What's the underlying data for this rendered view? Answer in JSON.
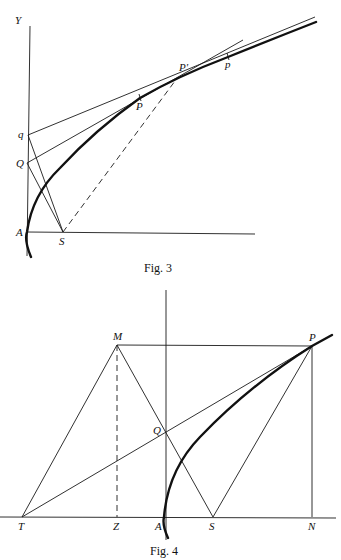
{
  "figures": [
    {
      "id": "fig3",
      "caption": "Fig. 3",
      "labels": {
        "Y": "Y",
        "q": "q",
        "Q": "Q",
        "A": "A",
        "S": "S",
        "P": "P",
        "P_prime": "P'",
        "p": "p"
      },
      "points": {
        "A": [
          27,
          232
        ],
        "S": [
          63,
          232
        ],
        "Q": [
          27,
          163
        ],
        "q": [
          28,
          135
        ],
        "P": [
          140,
          98
        ],
        "P_prime": [
          178,
          77
        ],
        "p": [
          228,
          57
        ]
      }
    },
    {
      "id": "fig4",
      "caption": "Fig. 4",
      "labels": {
        "M": "M",
        "P": "P",
        "Q": "Q",
        "T": "T",
        "Z": "Z",
        "A": "A",
        "S": "S",
        "N": "N"
      },
      "points": {
        "M": [
          117,
          345
        ],
        "P": [
          312,
          346
        ],
        "Q": [
          165,
          431
        ],
        "T": [
          22,
          517
        ],
        "Z": [
          117,
          517
        ],
        "A": [
          164,
          517
        ],
        "S": [
          213,
          517
        ],
        "N": [
          312,
          517
        ]
      }
    }
  ]
}
